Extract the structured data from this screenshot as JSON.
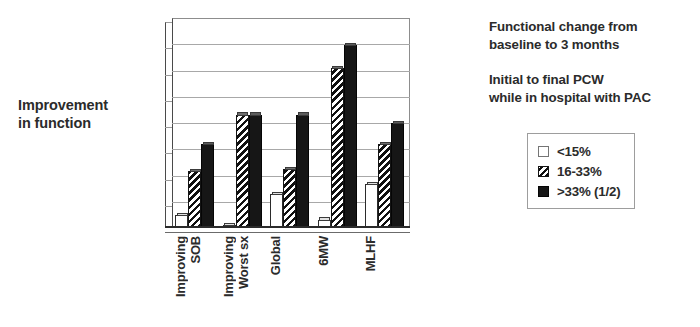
{
  "y_axis_caption": {
    "line1": "Improvement",
    "line2": "in function"
  },
  "annotations": [
    {
      "line1": "Functional change from",
      "line2": "baseline to 3 months"
    },
    {
      "line1": "Initial to final PCW",
      "line2": "while in hospital with PAC"
    }
  ],
  "legend": {
    "items": [
      {
        "label": "<15%",
        "swatch": "white-square-icon"
      },
      {
        "label": "16-33%",
        "swatch": "hatched-square-icon"
      },
      {
        "label": ">33% (1/2)",
        "swatch": "black-square-icon"
      }
    ]
  },
  "chart_data": {
    "type": "bar",
    "title": "",
    "xlabel": "",
    "ylabel": "Improvement in function",
    "grid": true,
    "gridlines": 8,
    "ylim": [
      0,
      1
    ],
    "legend_position": "right",
    "categories": [
      {
        "line1": "Improving",
        "line2": "SOB"
      },
      {
        "line1": "Improving",
        "line2": "Worst sx"
      },
      {
        "line1": "Global",
        "line2": ""
      },
      {
        "line1": "6MW",
        "line2": ""
      },
      {
        "line1": "MLHF",
        "line2": ""
      }
    ],
    "series": [
      {
        "name": "<15%",
        "style": "white",
        "values": [
          0.06,
          0.015,
          0.16,
          0.04,
          0.21
        ]
      },
      {
        "name": "16-33%",
        "style": "hatch",
        "values": [
          0.27,
          0.54,
          0.28,
          0.76,
          0.4
        ]
      },
      {
        "name": ">33% (1/2)",
        "style": "black",
        "values": [
          0.4,
          0.54,
          0.54,
          0.87,
          0.5
        ]
      }
    ]
  }
}
